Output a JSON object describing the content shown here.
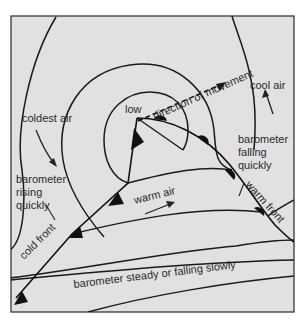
{
  "diagram": {
    "title": "",
    "background_color": "#e1e1e1",
    "line_color": "#1a1a1a",
    "labels": {
      "low": "low",
      "direction": "direction of movement",
      "coldest_air": "coldest air",
      "cool_air": "cool air",
      "barometer_rising_1": "barometer",
      "barometer_rising_2": "rising",
      "barometer_rising_3": "quickly",
      "barometer_falling_1": "barometer",
      "barometer_falling_2": "falling",
      "barometer_falling_3": "quickly",
      "warm_front": "warm front",
      "cold_front": "cold front",
      "warm_air": "warm air",
      "barometer_steady": "barometer steady or falling slowly"
    },
    "elements": [
      {
        "type": "low-pressure-center",
        "label": "low"
      },
      {
        "type": "cold-front",
        "symbol": "triangles",
        "label": "cold front"
      },
      {
        "type": "warm-front",
        "symbol": "semicircles",
        "label": "warm front"
      },
      {
        "type": "isobars",
        "count": 7
      },
      {
        "type": "arrow",
        "style": "dashed",
        "label": "direction of movement"
      },
      {
        "type": "arrow",
        "label": "coldest air"
      },
      {
        "type": "arrow",
        "label": "cool air"
      },
      {
        "type": "arrow",
        "label": "warm air"
      }
    ]
  }
}
